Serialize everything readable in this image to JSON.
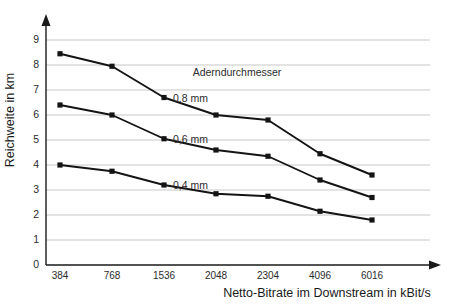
{
  "chart_data": {
    "type": "line",
    "title": "",
    "xlabel": "Netto-Bitrate im Downstream in kBit/s",
    "ylabel": "Reichweite in km",
    "categories": [
      "384",
      "768",
      "1536",
      "2048",
      "2304",
      "4096",
      "6016"
    ],
    "ylim": [
      0,
      9
    ],
    "ytick_labels": [
      "0",
      "1",
      "2",
      "3",
      "4",
      "5",
      "6",
      "7",
      "8",
      "9"
    ],
    "yticks": [
      0,
      1,
      2,
      3,
      4,
      5,
      6,
      7,
      8,
      9
    ],
    "grid": "horizontal",
    "legend_position": "inline-right-of-series",
    "legend_title": "Aderndurchmesser",
    "series": [
      {
        "name": "0,8 mm",
        "label": "0,8 mm",
        "values": [
          8.45,
          7.95,
          6.7,
          6.0,
          5.8,
          4.45,
          3.6
        ]
      },
      {
        "name": "0,6 mm",
        "label": "0,6 mm",
        "values": [
          6.4,
          6.0,
          5.05,
          4.6,
          4.35,
          3.4,
          2.7
        ]
      },
      {
        "name": "0,4 mm",
        "label": "0,4 mm",
        "values": [
          4.0,
          3.75,
          3.2,
          2.85,
          2.75,
          2.15,
          1.8
        ]
      }
    ],
    "colors": {
      "line": "#141414",
      "marker": "#141414",
      "grid": "#b9b9b9",
      "axis": "#1a1a1a",
      "background": "#ffffff"
    }
  }
}
